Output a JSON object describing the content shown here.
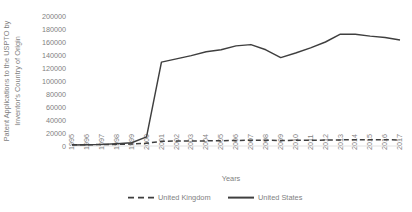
{
  "chart_data": {
    "type": "line",
    "title": "",
    "xlabel": "Years",
    "ylabel": "Patent Applications to the USPTO by Inventor's Country of Origin",
    "x": [
      1995,
      1996,
      1997,
      1998,
      1999,
      2000,
      2001,
      2002,
      2003,
      2004,
      2005,
      2006,
      2007,
      2008,
      2009,
      2010,
      2011,
      2012,
      2013,
      2014,
      2015,
      2016,
      2017
    ],
    "xticklabels": [
      "1995",
      "1996",
      "1997",
      "1998",
      "1999",
      "2000",
      "2001",
      "2002",
      "2003",
      "2004",
      "2005",
      "2006",
      "2007",
      "2008",
      "2009",
      "2010",
      "2011",
      "2012",
      "2013",
      "2014",
      "2015",
      "2016",
      "2017"
    ],
    "yticks": [
      0,
      20000,
      40000,
      60000,
      80000,
      100000,
      120000,
      140000,
      160000,
      180000,
      200000
    ],
    "yticklabels": [
      "0",
      "20000",
      "40000",
      "60000",
      "80000",
      "100000",
      "120000",
      "140000",
      "160000",
      "180000",
      "200000"
    ],
    "ylim": [
      0,
      200000
    ],
    "grid": false,
    "legend_position": "bottom",
    "series": [
      {
        "name": "United Kingdom",
        "style": "dashed",
        "color": "#3f3f3f",
        "values": [
          1800,
          2000,
          2200,
          2600,
          3000,
          4200,
          7200,
          7600,
          7800,
          7900,
          8100,
          8600,
          8800,
          8900,
          8500,
          8700,
          8900,
          9100,
          9400,
          9600,
          9600,
          9500,
          9400
        ]
      },
      {
        "name": "United States",
        "style": "solid",
        "color": "#3f3f3f",
        "values": [
          1500,
          2000,
          2500,
          3500,
          5000,
          14000,
          129000,
          134000,
          139000,
          145000,
          148000,
          154000,
          156000,
          148000,
          136000,
          143000,
          151000,
          160000,
          172000,
          172000,
          169000,
          167000,
          163000
        ]
      }
    ]
  },
  "legend": {
    "items": [
      {
        "label": "United Kingdom",
        "style": "dashed"
      },
      {
        "label": "United States",
        "style": "solid"
      }
    ]
  }
}
